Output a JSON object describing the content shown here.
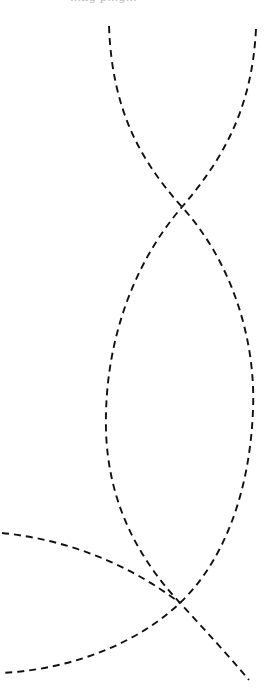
{
  "page": {
    "width": 271,
    "height": 695,
    "background": "#ffffff",
    "header_fragment": "…ng p…g…"
  },
  "figure": {
    "stroke_color": "#111111",
    "stroke_style": "dashed",
    "curves": [
      {
        "id": "curve-a",
        "description": "starts top-left, crosses upper intersection, bows to right edge, crosses lower intersection, exits bottom-left",
        "points": [
          [
            109,
            26
          ],
          [
            182,
            207
          ],
          [
            253,
            410
          ],
          [
            180,
            603
          ],
          [
            2,
            673
          ]
        ]
      },
      {
        "id": "curve-b",
        "description": "starts top-right, crosses upper intersection, bows to left edge, crosses lower intersection, exits bottom-right",
        "points": [
          [
            256,
            29
          ],
          [
            182,
            207
          ],
          [
            106,
            430
          ],
          [
            180,
            603
          ],
          [
            249,
            680
          ]
        ]
      },
      {
        "id": "curve-c",
        "description": "enters from left edge and arcs down to lower intersection",
        "points": [
          [
            2,
            533
          ],
          [
            180,
            603
          ]
        ]
      }
    ],
    "intersections": [
      {
        "id": "upper-crossing",
        "x": 182,
        "y": 207
      },
      {
        "id": "lower-crossing",
        "x": 180,
        "y": 603
      }
    ]
  }
}
